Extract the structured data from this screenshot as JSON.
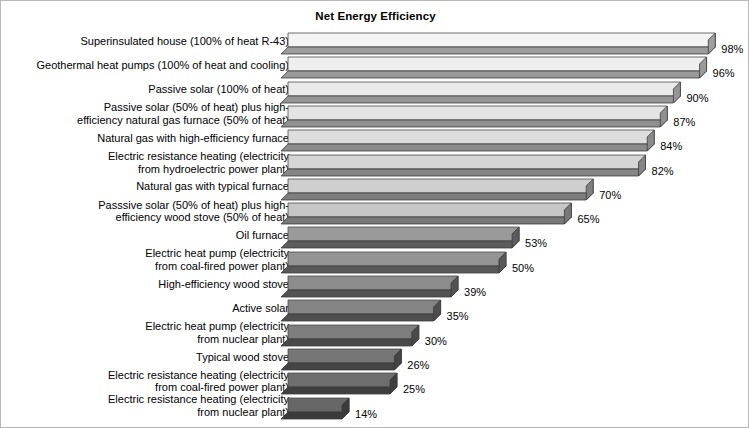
{
  "chart": {
    "title": "Net Energy Efficiency"
  },
  "chart_data": {
    "type": "bar",
    "orientation": "horizontal",
    "title": "Net Energy Efficiency",
    "xlabel": "",
    "ylabel": "",
    "xlim": [
      0,
      100
    ],
    "unit": "%",
    "grid": false,
    "legend": "none",
    "style": "3d-extruded-bars-grayscale-gradient",
    "categories": [
      "Superinsulated house (100% of heat R-43)",
      "Geothermal heat pumps (100% of heat and cooling)",
      "Passive solar (100% of heat)",
      "Passive solar (50% of heat) plus high-\nefficiency natural gas furnace (50% of heat)",
      "Natural gas with high-efficiency furnace",
      "Electric resistance heating (electricity\nfrom hydroelectric power plant)",
      "Natural gas with typical furnace",
      "Passsive solar (50% of heat) plus high-\nefficiency wood stove (50% of heat)",
      "Oil furnace",
      "Electric heat pump (electricity\nfrom coal-fired power plant)",
      "High-efficiency wood stove",
      "Active solar",
      "Electric heat pump (electricity\nfrom nuclear plant)",
      "Typical wood stove",
      "Electric resistance heating (electricity\nfrom coal-fired power plant)",
      "Electric resistance heating (electricity\nfrom nuclear plant)"
    ],
    "values": [
      98,
      96,
      90,
      87,
      84,
      82,
      70,
      65,
      53,
      50,
      39,
      35,
      30,
      26,
      25,
      14
    ],
    "value_labels": [
      "98%",
      "96%",
      "90%",
      "87%",
      "84%",
      "82%",
      "70%",
      "65%",
      "53%",
      "50%",
      "39%",
      "35%",
      "30%",
      "26%",
      "25%",
      "14%"
    ],
    "bar_colors": [
      "#f4f4f4",
      "#efefef",
      "#eaeaea",
      "#e4e4e4",
      "#dedede",
      "#d6d6d6",
      "#cfcfcf",
      "#c7c7c7",
      "#9a9a9a",
      "#949494",
      "#8c8c8c",
      "#858585",
      "#7d7d7d",
      "#767676",
      "#6e6e6e",
      "#676767"
    ],
    "bar_side_colors": [
      "#9e9e9e",
      "#9a9a9a",
      "#959595",
      "#909090",
      "#8b8b8b",
      "#858585",
      "#7f7f7f",
      "#797979",
      "#5c5c5c",
      "#585858",
      "#535353",
      "#4e4e4e",
      "#494949",
      "#444444",
      "#3f3f3f",
      "#3a3a3a"
    ]
  }
}
